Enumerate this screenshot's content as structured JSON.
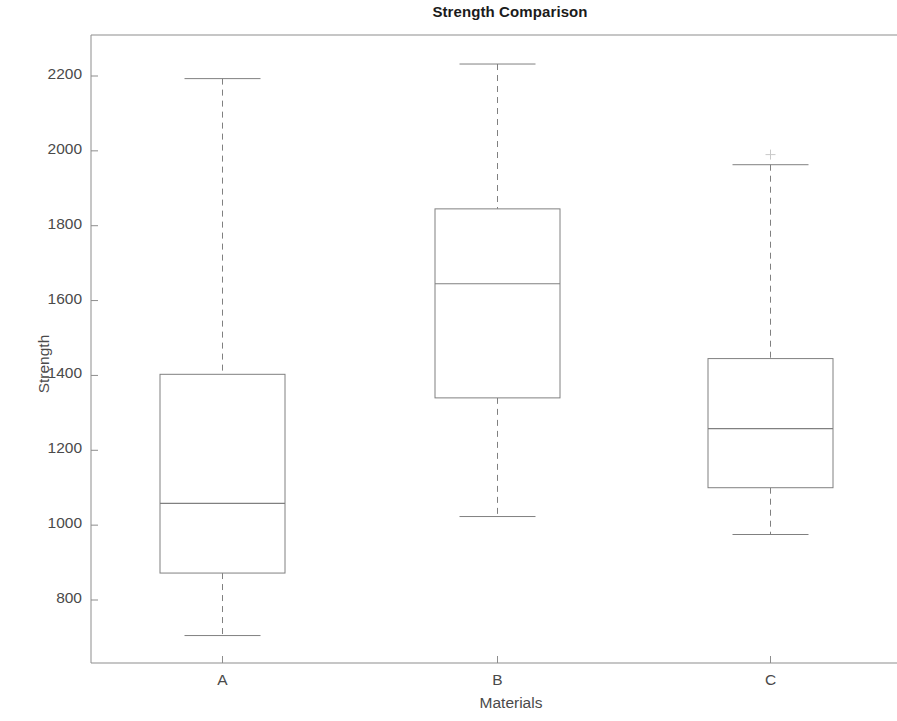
{
  "chart_data": {
    "type": "box",
    "title": "Strength Comparison",
    "xlabel": "Materials",
    "ylabel": "Strength",
    "categories": [
      "A",
      "B",
      "C"
    ],
    "ytick_labels": [
      "800",
      "1000",
      "1200",
      "1400",
      "1600",
      "1800",
      "2000",
      "2200"
    ],
    "ytick_values": [
      800,
      1000,
      1200,
      1400,
      1600,
      1800,
      2000,
      2200
    ],
    "ylim": [
      672,
      2290
    ],
    "grid": false,
    "legend": null,
    "line_color": "#808080",
    "box_fill": "#ffffff",
    "boxes": [
      {
        "label": "A",
        "whisker_low": 705,
        "q1": 872,
        "median": 1058,
        "q3": 1403,
        "whisker_high": 2193,
        "outliers": []
      },
      {
        "label": "B",
        "whisker_low": 1023,
        "q1": 1340,
        "median": 1645,
        "q3": 1845,
        "whisker_high": 2232,
        "outliers": []
      },
      {
        "label": "C",
        "whisker_low": 975,
        "q1": 1100,
        "median": 1258,
        "q3": 1445,
        "whisker_high": 1963,
        "outliers": [
          1990
        ]
      }
    ]
  }
}
